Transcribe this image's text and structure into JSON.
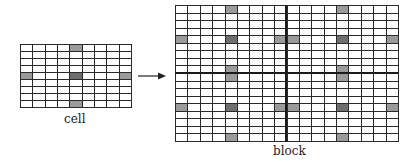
{
  "diagram": {
    "cell": {
      "label": "cell",
      "rows": 9,
      "cols": 9,
      "shaded": [
        {
          "row": 0,
          "col": 4,
          "tone": "light"
        },
        {
          "row": 4,
          "col": 0,
          "tone": "light"
        },
        {
          "row": 4,
          "col": 4,
          "tone": "dark"
        },
        {
          "row": 4,
          "col": 8,
          "tone": "light"
        },
        {
          "row": 8,
          "col": 4,
          "tone": "light"
        }
      ]
    },
    "block": {
      "label": "block",
      "tiles_x": 2,
      "tiles_y": 2,
      "composed_of": "cell"
    },
    "arrow": {
      "from": "cell",
      "to": "block",
      "icon": "arrow-right-icon"
    },
    "colors": {
      "grid_line": "#2a2a2a",
      "shade_light": "#9a9a9a",
      "shade_dark": "#6e6e6e",
      "background": "#ffffff"
    }
  }
}
